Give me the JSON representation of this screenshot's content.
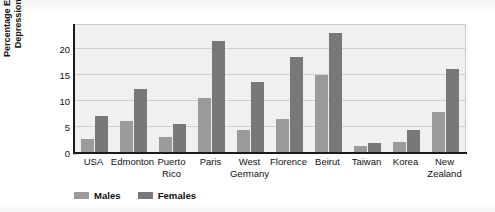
{
  "chart_data": {
    "type": "bar",
    "title": "",
    "xlabel": "",
    "ylabel": "Percentage Experiencing Major Depression during Lifetime",
    "ylabel_lines": [
      "Percentage Experiencing Major",
      "Depression during Lifetime"
    ],
    "categories": [
      "USA",
      "Edmonton",
      "Puerto Rico",
      "Paris",
      "West Germany",
      "Florence",
      "Beirut",
      "Taiwan",
      "Korea",
      "New Zealand"
    ],
    "category_lines": [
      [
        "USA",
        ""
      ],
      [
        "Edmonton",
        ""
      ],
      [
        "Puerto",
        "Rico"
      ],
      [
        "Paris",
        ""
      ],
      [
        "West",
        "Germany"
      ],
      [
        "Florence",
        ""
      ],
      [
        "Beirut",
        ""
      ],
      [
        "Taiwan",
        ""
      ],
      [
        "Korea",
        ""
      ],
      [
        "New",
        "Zealand"
      ]
    ],
    "series": [
      {
        "name": "Males",
        "color": "#9b9b9b",
        "values": [
          2.6,
          6.2,
          3.0,
          10.5,
          4.4,
          6.5,
          15.0,
          1.3,
          2.2,
          7.9
        ]
      },
      {
        "name": "Females",
        "color": "#787878",
        "values": [
          7.0,
          12.3,
          5.6,
          21.5,
          13.5,
          18.3,
          23.0,
          1.9,
          4.4,
          16.0
        ]
      }
    ],
    "ylim": [
      0,
      24.5
    ],
    "yticks": [
      0,
      5,
      10,
      15,
      20
    ],
    "ytick_labels": [
      "0",
      "5",
      "10",
      "15",
      "20"
    ],
    "grid": true,
    "grid_axis": "y",
    "legend_position": "bottom-left",
    "legend": [
      "Males",
      "Females"
    ],
    "plot_background": "#f0f0f0",
    "axis_color": "#1b1b1b",
    "grid_color": "#cfcfcf"
  }
}
